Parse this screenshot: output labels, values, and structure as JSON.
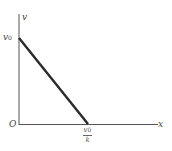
{
  "diagram": {
    "type": "graph",
    "axes": {
      "y_label": "v",
      "x_label": "x",
      "origin_label": "O"
    },
    "line": {
      "description": "linear decrease from v0 to zero",
      "start_label": "v",
      "start_sub": "0",
      "end_label_num": "v",
      "end_label_num_sub": "0",
      "end_label_den": "k"
    },
    "colors": {
      "axis": "#555555",
      "line": "#2a2a2a",
      "text": "#444444"
    }
  }
}
